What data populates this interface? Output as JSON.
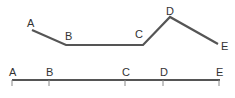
{
  "diagram": {
    "colors": {
      "line": "#555555",
      "label": "#333333",
      "background": "#ffffff"
    },
    "path": {
      "points": [
        {
          "label": "A",
          "x": 32,
          "y": 30,
          "lx": 27,
          "ly": 27
        },
        {
          "label": "B",
          "x": 66,
          "y": 45,
          "lx": 65,
          "ly": 40
        },
        {
          "label": "C",
          "x": 143,
          "y": 45,
          "lx": 135,
          "ly": 38
        },
        {
          "label": "D",
          "x": 170,
          "y": 17,
          "lx": 166,
          "ly": 15
        },
        {
          "label": "E",
          "x": 218,
          "y": 44,
          "lx": 221,
          "ly": 50
        }
      ]
    },
    "axis": {
      "y": 80,
      "x_start": 12,
      "x_end": 220,
      "ticks": [
        {
          "label": "A",
          "x": 12
        },
        {
          "label": "B",
          "x": 49
        },
        {
          "label": "C",
          "x": 125
        },
        {
          "label": "D",
          "x": 163
        },
        {
          "label": "E",
          "x": 219
        }
      ]
    }
  }
}
